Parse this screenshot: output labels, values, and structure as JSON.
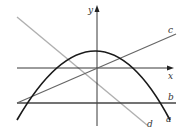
{
  "diagram": {
    "axes": {
      "x_label": "x",
      "y_label": "y"
    },
    "curves": [
      {
        "id": "a",
        "label": "a",
        "type": "parabola",
        "description": "downward-opening parabola with vertex above origin",
        "color": "#1a1a1a"
      },
      {
        "id": "b",
        "label": "b",
        "type": "horizontal-line",
        "description": "horizontal line below x-axis",
        "color": "#444444"
      },
      {
        "id": "c",
        "label": "c",
        "type": "line",
        "description": "line with positive slope through origin region",
        "color": "#666666"
      },
      {
        "id": "d",
        "label": "d",
        "type": "line",
        "description": "line with negative slope",
        "color": "#aaaaaa"
      }
    ]
  }
}
